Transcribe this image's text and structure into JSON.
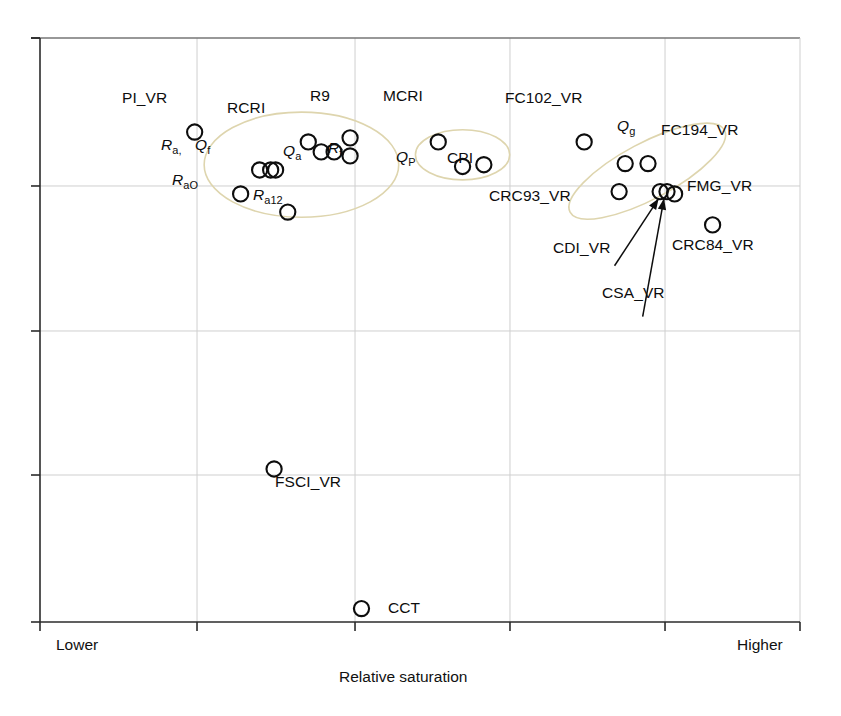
{
  "chart_data": {
    "type": "scatter",
    "title": "",
    "xlabel": "Relative saturation",
    "ylabel": "",
    "x_axis_endpoints": {
      "left": "Lower",
      "right": "Higher"
    },
    "grid": true,
    "legend_position": "none",
    "xlim": [
      0,
      1
    ],
    "ylim": [
      0,
      1
    ],
    "x_gridline_fractions": [
      0.0,
      0.2066,
      0.4145,
      0.6184,
      0.8224,
      1.0
    ],
    "y_gridline_fractions": [
      0.0,
      0.2517,
      0.4983,
      0.7466,
      1.0
    ],
    "marker_style": "open-circle",
    "points": [
      {
        "label": "PI_VR",
        "x": 0.2035,
        "y": 0.839,
        "group": "left"
      },
      {
        "label": "R_a,",
        "x": 0.289,
        "y": 0.774,
        "group": "left"
      },
      {
        "label": "Q_f",
        "x": 0.3035,
        "y": 0.774,
        "group": "left"
      },
      {
        "label": "Q_f2",
        "x": 0.31,
        "y": 0.774,
        "group": "left"
      },
      {
        "label": "R_aO",
        "x": 0.264,
        "y": 0.733,
        "group": "left"
      },
      {
        "label": "R_a12",
        "x": 0.326,
        "y": 0.702,
        "group": "left"
      },
      {
        "label": "RCRI",
        "x": 0.37,
        "y": 0.805,
        "group": "left"
      },
      {
        "label": "RCRI2",
        "x": 0.387,
        "y": 0.805,
        "group": "left"
      },
      {
        "label": "Q_a",
        "x": 0.353,
        "y": 0.822,
        "group": "left"
      },
      {
        "label": "R9a",
        "x": 0.408,
        "y": 0.829,
        "group": "left"
      },
      {
        "label": "R9b",
        "x": 0.408,
        "y": 0.798,
        "group": "left"
      },
      {
        "label": "MCRI",
        "x": 0.524,
        "y": 0.822,
        "group": "middle"
      },
      {
        "label": "Q_P",
        "x": 0.556,
        "y": 0.78,
        "group": "middle"
      },
      {
        "label": "CPI",
        "x": 0.584,
        "y": 0.783,
        "group": "middle"
      },
      {
        "label": "FC102_VR",
        "x": 0.716,
        "y": 0.822,
        "group": "right"
      },
      {
        "label": "Q_g",
        "x": 0.77,
        "y": 0.785,
        "group": "right"
      },
      {
        "label": "FC194_VR",
        "x": 0.8,
        "y": 0.785,
        "group": "right"
      },
      {
        "label": "CRC93_VR",
        "x": 0.762,
        "y": 0.737,
        "group": "right"
      },
      {
        "label": "CDI_VR",
        "x": 0.816,
        "y": 0.737,
        "group": "right"
      },
      {
        "label": "CSA_VR",
        "x": 0.825,
        "y": 0.737,
        "group": "right"
      },
      {
        "label": "FMG_VR",
        "x": 0.835,
        "y": 0.733,
        "group": "right"
      },
      {
        "label": "CRC84_VR",
        "x": 0.885,
        "y": 0.68,
        "group": "right"
      },
      {
        "label": "FSCI_VR",
        "x": 0.308,
        "y": 0.262,
        "group": "none"
      },
      {
        "label": "CCT",
        "x": 0.423,
        "y": 0.023,
        "group": "none"
      }
    ],
    "cluster_ellipses": [
      {
        "name": "left-cluster",
        "cx": 0.344,
        "cy": 0.783,
        "rx": 0.128,
        "ry": 0.09,
        "rotation": 0
      },
      {
        "name": "middle-cluster",
        "cx": 0.556,
        "cy": 0.8,
        "rx": 0.062,
        "ry": 0.043,
        "rotation": 0
      },
      {
        "name": "right-cluster",
        "cx": 0.799,
        "cy": 0.772,
        "rx": 0.115,
        "ry": 0.048,
        "rotation": -28
      }
    ],
    "annotation_arrows": [
      {
        "label": "CDI_VR",
        "from_x": 0.756,
        "from_y": 0.61,
        "to_x": 0.814,
        "to_y": 0.725
      },
      {
        "label": "CSA_VR",
        "from_x": 0.793,
        "from_y": 0.523,
        "to_x": 0.821,
        "to_y": 0.725
      }
    ],
    "colors": {
      "marker_stroke": "#0d0d0d",
      "grid": "#cfcfcf",
      "axis": "#2b2b2b",
      "ellipse": "#ded5ae",
      "text": "#0d0d0d"
    }
  },
  "labels": {
    "pi_vr": "PI_VR",
    "rcri": "RCRI",
    "r9": "R9",
    "r_a_comma_base": "R",
    "r_a_comma_sub": "a,",
    "q_f_base": "Q",
    "q_f_sub": "f",
    "q_a_base": "Q",
    "q_a_sub": "a",
    "r_f_base": "R",
    "r_f_sub": "f",
    "r_ao_base": "R",
    "r_ao_sub": "aO",
    "r_a12_base": "R",
    "r_a12_sub": "a12",
    "mcri": "MCRI",
    "q_p_base": "Q",
    "q_p_sub": "P",
    "cpi": "CPI",
    "fc102_vr": "FC102_VR",
    "q_g_base": "Q",
    "q_g_sub": "g",
    "fc194_vr": "FC194_VR",
    "crc93_vr": "CRC93_VR",
    "fmg_vr": "FMG_VR",
    "cdi_vr": "CDI_VR",
    "csa_vr": "CSA_VR",
    "crc84_vr": "CRC84_VR",
    "fsci_vr": "FSCI_VR",
    "cct": "CCT",
    "axis_left": "Lower",
    "axis_right": "Higher",
    "axis_title": "Relative saturation"
  }
}
